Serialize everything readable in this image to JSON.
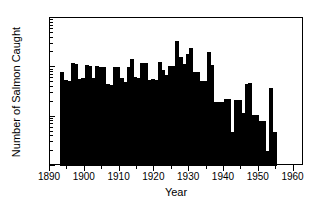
{
  "chart_data": {
    "type": "bar",
    "title": "",
    "xlabel": "Year",
    "ylabel": "Number of Salmon Caught",
    "yscale": "log",
    "ylim": [
      1,
      1000
    ],
    "xlim": [
      1890,
      1963
    ],
    "grid": false,
    "legend": null,
    "y_tick_labels": [
      "1000",
      "100",
      "10",
      "1"
    ],
    "y_tick_values": [
      1000,
      100,
      10,
      1
    ],
    "x_tick_labels": [
      "1890",
      "1900",
      "1910",
      "1920",
      "1930",
      "1940",
      "1950",
      "1960"
    ],
    "x_tick_values": [
      1890,
      1900,
      1910,
      1920,
      1930,
      1940,
      1950,
      1960
    ],
    "x": [
      1893,
      1894,
      1895,
      1896,
      1897,
      1898,
      1899,
      1900,
      1901,
      1902,
      1903,
      1904,
      1905,
      1906,
      1907,
      1908,
      1909,
      1910,
      1911,
      1912,
      1913,
      1914,
      1915,
      1916,
      1917,
      1918,
      1919,
      1920,
      1921,
      1922,
      1923,
      1924,
      1925,
      1926,
      1927,
      1928,
      1929,
      1930,
      1931,
      1932,
      1933,
      1934,
      1935,
      1936,
      1937,
      1938,
      1939,
      1940,
      1941,
      1942,
      1943,
      1944,
      1945,
      1946,
      1947,
      1948,
      1949,
      1950,
      1951,
      1952,
      1953,
      1954
    ],
    "values": [
      80,
      55,
      54,
      120,
      118,
      57,
      60,
      110,
      105,
      60,
      105,
      104,
      100,
      45,
      43,
      100,
      100,
      60,
      50,
      100,
      150,
      65,
      62,
      120,
      120,
      56,
      57,
      55,
      130,
      90,
      70,
      108,
      105,
      350,
      165,
      115,
      190,
      245,
      80,
      80,
      52,
      52,
      200,
      110,
      20,
      20,
      20,
      23,
      23,
      5,
      22,
      22,
      12,
      45,
      48,
      11,
      11,
      8,
      8,
      2,
      38,
      5
    ],
    "units": "count"
  }
}
